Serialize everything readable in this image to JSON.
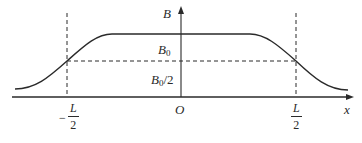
{
  "figure": {
    "type": "magnetic field profile along axis",
    "colors": {
      "line": "#2a2a2a",
      "background": "#ffffff"
    },
    "axes": {
      "x_label": "x",
      "y_label": "B",
      "origin_label": "O"
    },
    "levels": {
      "plateau_label": "B",
      "plateau_sub": "0",
      "half_label": "B",
      "half_sub": "0",
      "half_suffix": "/2"
    },
    "markers": {
      "left": {
        "sign": "−",
        "numerator": "L",
        "denominator": "2"
      },
      "right": {
        "numerator": "L",
        "denominator": "2"
      }
    },
    "curve": {
      "description": "Smooth symmetric plateau: rises from near zero at far left, passes B0/2 at x=-L/2, flat at B0 through center, falls through B0/2 at x=L/2 to near zero at far right",
      "points_normalized": [
        {
          "x": "-∞",
          "B": "≈0"
        },
        {
          "x": "-L/2",
          "B": "B0/2"
        },
        {
          "x": "0",
          "B": "B0"
        },
        {
          "x": "L/2",
          "B": "B0/2"
        },
        {
          "x": "+∞",
          "B": "≈0"
        }
      ]
    }
  }
}
